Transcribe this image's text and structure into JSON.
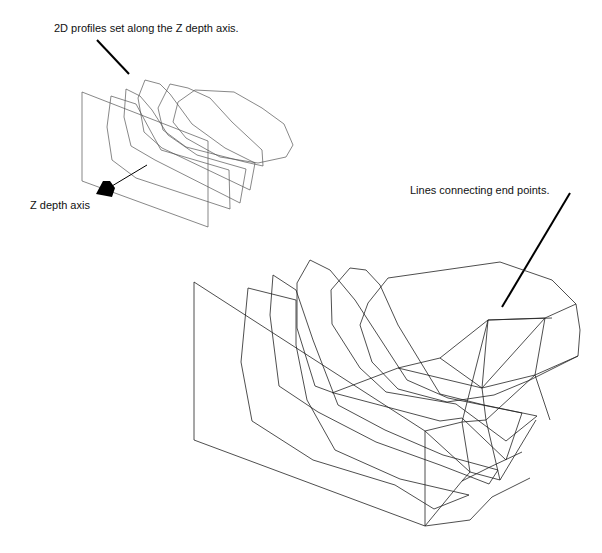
{
  "figure": {
    "labels": {
      "profiles": "2D profiles set along the Z depth axis.",
      "z_axis": "Z depth axis",
      "lines": "Lines connecting end points."
    },
    "colors": {
      "background": "#ffffff",
      "line": "#222222",
      "pointer": "#000000"
    }
  }
}
